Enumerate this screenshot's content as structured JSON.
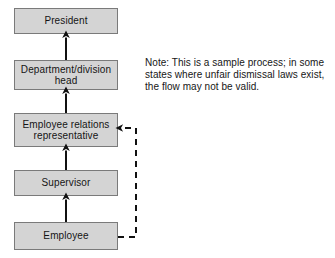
{
  "diagram": {
    "type": "flowchart",
    "orientation": "bottom-up",
    "colors": {
      "node_fill": "#d4d4d4",
      "node_border": "#7a7a7a",
      "connector": "#111111",
      "text": "#141414",
      "background": "#ffffff"
    },
    "nodes": [
      {
        "id": "president",
        "label": "President"
      },
      {
        "id": "dept-head",
        "label": "Department/division head"
      },
      {
        "id": "er-rep",
        "label": "Employee relations representative"
      },
      {
        "id": "supervisor",
        "label": "Supervisor"
      },
      {
        "id": "employee",
        "label": "Employee"
      }
    ],
    "edges": [
      {
        "id": "employee-to-supervisor",
        "from": "employee",
        "to": "supervisor",
        "style": "solid",
        "arrow": "up"
      },
      {
        "id": "supervisor-to-er-rep",
        "from": "supervisor",
        "to": "er-rep",
        "style": "solid",
        "arrow": "up"
      },
      {
        "id": "er-rep-to-dept-head",
        "from": "er-rep",
        "to": "dept-head",
        "style": "solid",
        "arrow": "up"
      },
      {
        "id": "dept-head-to-president",
        "from": "dept-head",
        "to": "president",
        "style": "solid",
        "arrow": "up"
      },
      {
        "id": "employee-to-er-rep-direct",
        "from": "employee",
        "to": "er-rep",
        "style": "dashed",
        "arrow": "left"
      }
    ]
  },
  "note": {
    "lines": [
      "Note: This is a sample process; in some",
      "states where unfair dismissal laws exist,",
      "the flow may not be valid."
    ]
  }
}
